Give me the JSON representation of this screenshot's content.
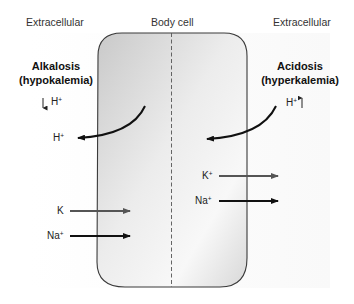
{
  "headers": {
    "left": "Extracellular",
    "center": "Body cell",
    "right": "Extracellular"
  },
  "alkalosis": {
    "title": "Alkalosis",
    "subtitle": "(hypokalemia)",
    "h_change_label": "H",
    "h_change_charge": "+",
    "h_change_direction": "down",
    "h_flux_label": "H",
    "h_flux_charge": "+",
    "h_flux_direction": "out of cell",
    "k_label": "K",
    "k_charge": "",
    "k_direction": "into cell",
    "na_label": "Na",
    "na_charge": "+",
    "na_direction": "into cell"
  },
  "acidosis": {
    "title": "Acidosis",
    "subtitle": "(hyperkalemia)",
    "h_change_label": "H",
    "h_change_charge": "+",
    "h_change_direction": "up",
    "h_flux_direction": "into cell",
    "k_label": "K",
    "k_charge": "+",
    "k_direction": "out of cell",
    "na_label": "Na",
    "na_charge": "+",
    "na_direction": "out of cell"
  },
  "colors": {
    "cell_outline": "#3a3a3a",
    "cell_fill_dark": "#cfcfcf",
    "cell_fill_light": "#f7f7f7",
    "k_arrow": "#555555",
    "na_arrow": "#111111",
    "h_arrow": "#111111"
  }
}
